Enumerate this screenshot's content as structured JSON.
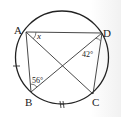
{
  "diagram": {
    "type": "inscribed quadrilateral in circle",
    "points": {
      "A": {
        "label": "A"
      },
      "B": {
        "label": "B"
      },
      "C": {
        "label": "C"
      },
      "D": {
        "label": "D"
      }
    },
    "angles": {
      "DAC": {
        "label": "x"
      },
      "ADB": {
        "label": "42°"
      },
      "ABD": {
        "label": "56°"
      }
    },
    "tick_marks": {
      "arc_AB": "single tick",
      "arc_BC": "double tick"
    },
    "colors": {
      "stroke": "#222222",
      "background": "#ffffff"
    }
  }
}
